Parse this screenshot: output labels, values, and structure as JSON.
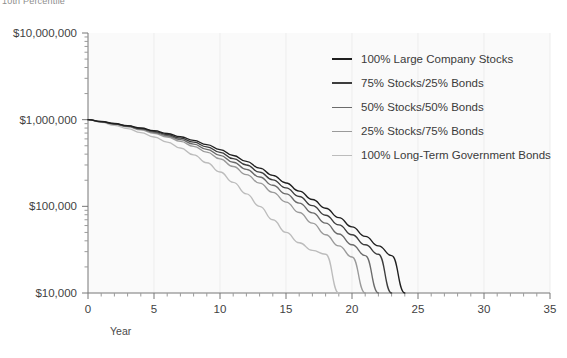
{
  "title": "10th Percentile",
  "axes": {
    "x_title": "Year",
    "x_ticks": [
      "0",
      "5",
      "10",
      "15",
      "20",
      "25",
      "30",
      "35"
    ],
    "y_ticks": [
      "$10,000,000",
      "$1,000,000",
      "$100,000",
      "$10,000"
    ]
  },
  "legend": {
    "items": [
      {
        "label": "100% Large Company Stocks",
        "color": "#1f1f1f"
      },
      {
        "label": "75% Stocks/25% Bonds",
        "color": "#3d3d3d"
      },
      {
        "label": "50% Stocks/50% Bonds",
        "color": "#6b6b6b"
      },
      {
        "label": "25% Stocks/75% Bonds",
        "color": "#9a9a9a"
      },
      {
        "label": "100% Long-Term Government Bonds",
        "color": "#bcbcbc"
      }
    ]
  },
  "chart_data": {
    "type": "line",
    "title": "10th Percentile",
    "xlabel": "Year",
    "ylabel": "",
    "xlim": [
      0,
      35
    ],
    "ylim": [
      10000,
      10000000
    ],
    "yscale": "log",
    "grid": true,
    "legend_position": "inside-top-right",
    "x": [
      0,
      1,
      2,
      3,
      4,
      5,
      6,
      7,
      8,
      9,
      10,
      11,
      12,
      13,
      14,
      15,
      16,
      17,
      18,
      19,
      20,
      21,
      22,
      23,
      24,
      25
    ],
    "series": [
      {
        "name": "100% Large Company Stocks",
        "color": "#1f1f1f",
        "values": [
          1000000,
          952000,
          903000,
          853000,
          801000,
          748000,
          693000,
          636000,
          577000,
          516000,
          452000,
          386000,
          330000,
          276000,
          228000,
          186000,
          150000,
          120000,
          95000,
          74000,
          58000,
          45000,
          35000,
          27000,
          10000,
          null
        ]
      },
      {
        "name": "75% Stocks/25% Bonds",
        "color": "#3d3d3d",
        "values": [
          1000000,
          950000,
          898000,
          845000,
          790000,
          733000,
          674000,
          613000,
          550000,
          486000,
          420000,
          355000,
          300000,
          248000,
          202000,
          163000,
          130000,
          102000,
          79000,
          61000,
          47000,
          36000,
          28000,
          10000,
          null,
          null
        ]
      },
      {
        "name": "50% Stocks/50% Bonds",
        "color": "#6b6b6b",
        "values": [
          1000000,
          947000,
          892000,
          836000,
          777000,
          716000,
          653000,
          588000,
          522000,
          455000,
          388000,
          323000,
          267000,
          218000,
          175000,
          139000,
          109000,
          84000,
          64000,
          48000,
          36000,
          27000,
          10000,
          null,
          null,
          null
        ]
      },
      {
        "name": "25% Stocks/75% Bonds",
        "color": "#9a9a9a",
        "values": [
          1000000,
          944000,
          886000,
          826000,
          763000,
          698000,
          631000,
          562000,
          492000,
          422000,
          353000,
          288000,
          232000,
          185000,
          145000,
          112000,
          85000,
          64000,
          47000,
          35000,
          26000,
          10000,
          null,
          null,
          null,
          null
        ]
      },
      {
        "name": "100% Long-Term Government Bonds",
        "color": "#bcbcbc",
        "values": [
          1000000,
          932000,
          861000,
          787000,
          710000,
          631000,
          551000,
          471000,
          393000,
          318000,
          249000,
          189000,
          139000,
          100000,
          70000,
          50000,
          38000,
          31000,
          28000,
          10000,
          null,
          null,
          null,
          null,
          null,
          null
        ]
      }
    ]
  }
}
